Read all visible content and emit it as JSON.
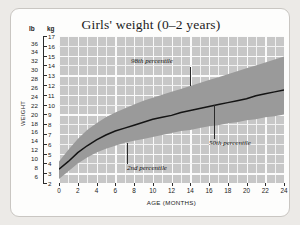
{
  "chart_data": {
    "type": "area",
    "title": "Girls' weight (0–2 years)",
    "xlabel": "AGE (MONTHS)",
    "ylabel": "WEIGHT",
    "unit_left": "lb",
    "unit_right": "kg",
    "grid": true,
    "legend_position": "inline-annotations",
    "xlim": [
      0,
      24
    ],
    "xticks": [
      0,
      2,
      4,
      6,
      8,
      10,
      12,
      14,
      16,
      18,
      20,
      22,
      24
    ],
    "ylim_kg": [
      2,
      17
    ],
    "yticks_kg": [
      2,
      3,
      4,
      5,
      6,
      7,
      8,
      9,
      10,
      11,
      12,
      13,
      14,
      15,
      16,
      17
    ],
    "ylim_lb": [
      4,
      37
    ],
    "yticks_lb": [
      6,
      8,
      10,
      12,
      14,
      16,
      18,
      20,
      22,
      24,
      26,
      28,
      30,
      32,
      34,
      36
    ],
    "x": [
      0,
      1,
      2,
      3,
      4,
      5,
      6,
      7,
      8,
      9,
      10,
      11,
      12,
      13,
      14,
      15,
      16,
      17,
      18,
      19,
      20,
      21,
      22,
      23,
      24
    ],
    "series": [
      {
        "name": "2nd percentile",
        "unit": "kg",
        "values": [
          2.4,
          3.2,
          4.0,
          4.6,
          5.1,
          5.5,
          5.8,
          6.1,
          6.3,
          6.5,
          6.7,
          6.9,
          7.1,
          7.3,
          7.4,
          7.6,
          7.8,
          7.9,
          8.1,
          8.2,
          8.4,
          8.5,
          8.7,
          8.8,
          9.0
        ]
      },
      {
        "name": "50th percentile",
        "unit": "kg",
        "values": [
          3.4,
          4.2,
          5.1,
          5.8,
          6.4,
          6.9,
          7.3,
          7.6,
          7.9,
          8.2,
          8.5,
          8.7,
          8.9,
          9.2,
          9.4,
          9.6,
          9.8,
          10.0,
          10.2,
          10.4,
          10.6,
          10.9,
          11.1,
          11.3,
          11.5
        ]
      },
      {
        "name": "98th percentile",
        "unit": "kg",
        "values": [
          4.2,
          5.4,
          6.5,
          7.4,
          8.1,
          8.7,
          9.2,
          9.6,
          10.0,
          10.4,
          10.7,
          11.0,
          11.3,
          11.6,
          11.9,
          12.2,
          12.5,
          12.8,
          13.1,
          13.4,
          13.7,
          14.0,
          14.3,
          14.6,
          14.9
        ]
      }
    ],
    "annotations": [
      {
        "text": "98th percentile",
        "at_month": 14.0
      },
      {
        "text": "50th percentile",
        "at_month": 16.5
      },
      {
        "text": "2nd percentile",
        "at_month": 7.3
      }
    ],
    "colors": {
      "plot_background": "#c7c7c7",
      "gridline": "#f2f2f2",
      "band_fill": "#9a9a9a",
      "median_line": "#141414",
      "card_background": "#fdfdfc",
      "page_background": "#eceae7"
    }
  }
}
